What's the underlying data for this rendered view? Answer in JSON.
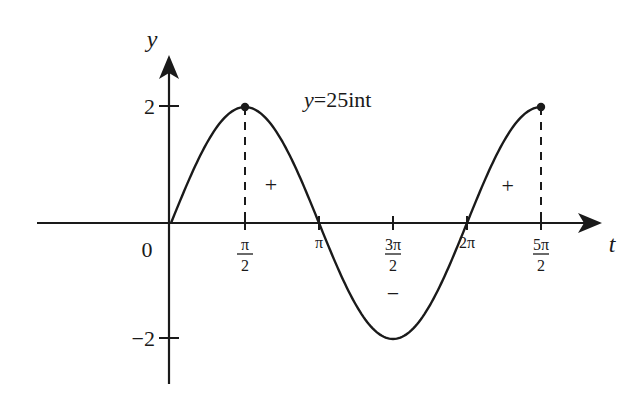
{
  "chart_data": {
    "type": "line",
    "title": "y=25int",
    "function": "y = 2 sin t",
    "xlabel": "t",
    "ylabel": "y",
    "origin_label": "0",
    "x_range_units_of_pi_over_2": [
      0,
      5
    ],
    "xlim_pi_over_2": [
      -1.8,
      5.8
    ],
    "ylim": [
      -2.6,
      2.6
    ],
    "grid": false,
    "x_ticks": [
      {
        "value_pi_over_2": 1,
        "label_num": "π",
        "label_den": "2",
        "kind": "fraction"
      },
      {
        "value_pi_over_2": 2,
        "label": "π",
        "kind": "plain"
      },
      {
        "value_pi_over_2": 3,
        "label_num": "3π",
        "label_den": "2",
        "kind": "fraction"
      },
      {
        "value_pi_over_2": 4,
        "label": "2π",
        "kind": "plain"
      },
      {
        "value_pi_over_2": 5,
        "label_num": "5π",
        "label_den": "2",
        "kind": "fraction"
      }
    ],
    "y_ticks": [
      {
        "value": 2,
        "label": "2"
      },
      {
        "value": -2,
        "label": "−2"
      }
    ],
    "amplitude": 2,
    "marked_points": [
      {
        "t_pi_over_2": 1,
        "y": 2
      },
      {
        "t_pi_over_2": 5,
        "y": 2
      }
    ],
    "dashed_guides_at_pi_over_2": [
      1,
      5
    ],
    "sign_annotations": [
      {
        "text": "+",
        "t_pi_over_2": 1.35,
        "y": 0.65
      },
      {
        "text": "−",
        "t_pi_over_2": 3.0,
        "y": -1.22
      },
      {
        "text": "+",
        "t_pi_over_2": 4.55,
        "y": 0.63
      }
    ]
  }
}
